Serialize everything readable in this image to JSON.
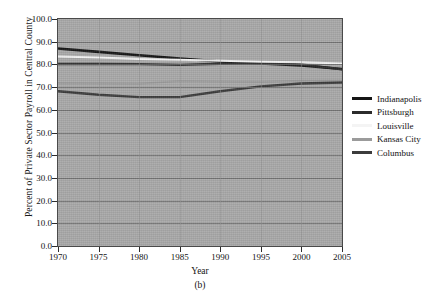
{
  "chart_data": {
    "type": "line",
    "title": "",
    "caption": "(b)",
    "xlabel": "Year",
    "ylabel": "Percent of Private Sector Payroll in Central County",
    "x": [
      1970,
      1975,
      1980,
      1985,
      1990,
      1995,
      2000,
      2005
    ],
    "xticklabels": [
      "1970",
      "1975",
      "1980",
      "1985",
      "1990",
      "1995",
      "2000",
      "2005"
    ],
    "yticklabels": [
      "0.0",
      "10.0",
      "20.0",
      "30.0",
      "40.0",
      "50.0",
      "60.0",
      "70.0",
      "80.0",
      "90.0",
      "100.0"
    ],
    "yticks": [
      0,
      10,
      20,
      30,
      40,
      50,
      60,
      70,
      80,
      90,
      100
    ],
    "xlim": [
      1970,
      2005
    ],
    "ylim": [
      0,
      100
    ],
    "grid": true,
    "grid_axis": "y",
    "legend_position": "right",
    "plot_background": "#a8a8a8",
    "series": [
      {
        "name": "Indianapolis",
        "color": "#161616",
        "width": 2.6,
        "values": [
          87.0,
          85.5,
          84.0,
          82.6,
          81.3,
          80.4,
          79.5,
          78.0
        ]
      },
      {
        "name": "Pittsburgh",
        "color": "#2b2b2b",
        "width": 2.4,
        "values": [
          80.2,
          80.2,
          80.1,
          79.8,
          80.3,
          80.6,
          80.0,
          77.8
        ]
      },
      {
        "name": "Louisville",
        "color": "#f2f2f2",
        "width": 2.0,
        "values": [
          83.5,
          83.0,
          82.4,
          82.0,
          81.6,
          81.2,
          81.0,
          80.4
        ]
      },
      {
        "name": "Kansas City",
        "color": "#9b9b9b",
        "width": 1.8,
        "values": [
          71.7,
          71.6,
          71.5,
          72.6,
          72.4,
          72.3,
          72.8,
          73.0
        ]
      },
      {
        "name": "Columbus",
        "color": "#3c3c3c",
        "width": 2.4,
        "values": [
          68.2,
          66.6,
          65.6,
          65.6,
          68.2,
          70.3,
          71.6,
          72.0
        ]
      }
    ]
  },
  "legend": {
    "items": [
      {
        "label": "Indianapolis",
        "color": "#161616"
      },
      {
        "label": "Pittsburgh",
        "color": "#2b2b2b"
      },
      {
        "label": "Louisville",
        "color": "#f4f4f4"
      },
      {
        "label": "Kansas City",
        "color": "#9b9b9b"
      },
      {
        "label": "Columbus",
        "color": "#3c3c3c"
      }
    ]
  }
}
